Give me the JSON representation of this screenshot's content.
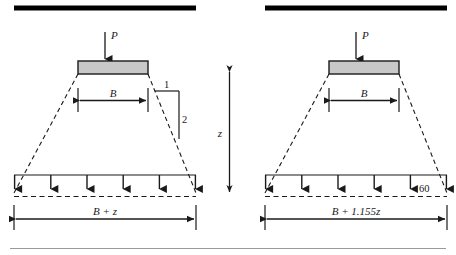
{
  "figure": {
    "background_color": "#ffffff",
    "ink_color": "#1a1a1a",
    "footing_fill_color": "#c8c8c8",
    "footing_stroke_color": "#1a1a1a",
    "ground_bar_color": "#000000",
    "rule_color": "#9a9a9a"
  },
  "panels": [
    {
      "id": "left-panel",
      "name": "two-to-one-method",
      "load_label": "P",
      "footing_width_label": "B",
      "slope_rise_label": "1",
      "slope_run_label": "2",
      "angle_label": "",
      "spread_width_label": "B + z",
      "arrow_count": 6,
      "ground_bar": {
        "x1": 14,
        "x2": 196,
        "y": 8
      }
    },
    {
      "id": "right-panel",
      "name": "sixty-degree-method",
      "load_label": "P",
      "footing_width_label": "B",
      "slope_rise_label": "",
      "slope_run_label": "",
      "angle_label": "60",
      "spread_width_label": "B + 1.155z",
      "arrow_count": 6,
      "ground_bar": {
        "x1": 265,
        "x2": 447,
        "y": 8
      }
    }
  ],
  "center": {
    "depth_label": "z"
  }
}
